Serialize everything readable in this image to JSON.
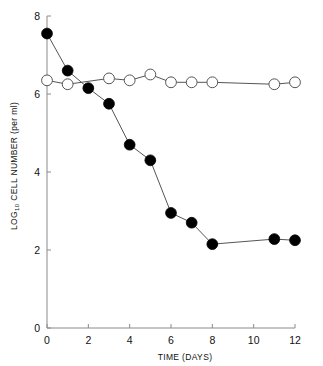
{
  "chart_data": {
    "type": "line",
    "title": "",
    "xlabel": "TIME (DAYS)",
    "ylabel_main": "CELL NUMBER (per ml)",
    "ylabel_prefix": "LOG",
    "ylabel_subscript": "10",
    "ylabel_full": "LOG10 CELL NUMBER (per ml)",
    "xlim": [
      0,
      12
    ],
    "ylim": [
      0,
      8
    ],
    "xticks": [
      0,
      2,
      4,
      6,
      8,
      10,
      12
    ],
    "yticks": [
      0,
      2,
      4,
      6,
      8
    ],
    "xtick_labels": [
      "0",
      "2",
      "4",
      "6",
      "8",
      "10",
      "12"
    ],
    "ytick_labels": [
      "0",
      "2",
      "4",
      "6",
      "8"
    ],
    "grid": false,
    "legend_position": "none",
    "marker_size_px": 5.4,
    "line_color": "#555555",
    "filled_marker_color": "#000000",
    "open_marker_fill": "#ffffff",
    "open_marker_stroke": "#555555",
    "axis_color": "#8a8a8a",
    "series": [
      {
        "name": "filled-circles",
        "marker": "filled-circle",
        "x": [
          0,
          1,
          2,
          3,
          4,
          5,
          6,
          7,
          8,
          11,
          12
        ],
        "values": [
          7.55,
          6.6,
          6.15,
          5.75,
          4.7,
          4.3,
          2.95,
          2.7,
          2.15,
          2.28,
          2.25
        ]
      },
      {
        "name": "open-circles",
        "marker": "open-circle",
        "x": [
          0,
          1,
          3,
          4,
          5,
          6,
          7,
          8,
          11,
          12
        ],
        "values": [
          6.35,
          6.25,
          6.4,
          6.35,
          6.5,
          6.3,
          6.3,
          6.3,
          6.25,
          6.3
        ]
      }
    ]
  }
}
